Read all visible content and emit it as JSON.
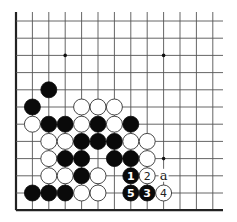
{
  "diagram": {
    "type": "go-board-fragment",
    "visible_columns": 13,
    "visible_rows": 12,
    "edges": [
      "left",
      "bottom"
    ],
    "colors": {
      "black": "#0a0a0a",
      "white": "#ffffff",
      "line": "#555555"
    },
    "star_points": [
      {
        "col": 3,
        "row": 2
      },
      {
        "col": 9,
        "row": 2
      },
      {
        "col": 9,
        "row": 8
      }
    ],
    "stones": [
      {
        "col": 2,
        "row": 4,
        "color": "black"
      },
      {
        "col": 1,
        "row": 5,
        "color": "black"
      },
      {
        "col": 4,
        "row": 5,
        "color": "white"
      },
      {
        "col": 5,
        "row": 5,
        "color": "white"
      },
      {
        "col": 6,
        "row": 5,
        "color": "white"
      },
      {
        "col": 1,
        "row": 6,
        "color": "white"
      },
      {
        "col": 2,
        "row": 6,
        "color": "black"
      },
      {
        "col": 3,
        "row": 6,
        "color": "black"
      },
      {
        "col": 4,
        "row": 6,
        "color": "white"
      },
      {
        "col": 5,
        "row": 6,
        "color": "black"
      },
      {
        "col": 6,
        "row": 6,
        "color": "white"
      },
      {
        "col": 7,
        "row": 6,
        "color": "black"
      },
      {
        "col": 2,
        "row": 7,
        "color": "white"
      },
      {
        "col": 3,
        "row": 7,
        "color": "white"
      },
      {
        "col": 4,
        "row": 7,
        "color": "black"
      },
      {
        "col": 5,
        "row": 7,
        "color": "black"
      },
      {
        "col": 6,
        "row": 7,
        "color": "black"
      },
      {
        "col": 7,
        "row": 7,
        "color": "white"
      },
      {
        "col": 8,
        "row": 7,
        "color": "white"
      },
      {
        "col": 2,
        "row": 8,
        "color": "white"
      },
      {
        "col": 3,
        "row": 8,
        "color": "black"
      },
      {
        "col": 4,
        "row": 8,
        "color": "black"
      },
      {
        "col": 6,
        "row": 8,
        "color": "black"
      },
      {
        "col": 7,
        "row": 8,
        "color": "black"
      },
      {
        "col": 8,
        "row": 8,
        "color": "white"
      },
      {
        "col": 2,
        "row": 9,
        "color": "white"
      },
      {
        "col": 3,
        "row": 9,
        "color": "white"
      },
      {
        "col": 4,
        "row": 9,
        "color": "black"
      },
      {
        "col": 5,
        "row": 9,
        "color": "white"
      },
      {
        "col": 7,
        "row": 9,
        "color": "black",
        "label": "1"
      },
      {
        "col": 8,
        "row": 9,
        "color": "white",
        "label": "2"
      },
      {
        "col": 1,
        "row": 10,
        "color": "black"
      },
      {
        "col": 2,
        "row": 10,
        "color": "black"
      },
      {
        "col": 3,
        "row": 10,
        "color": "black"
      },
      {
        "col": 4,
        "row": 10,
        "color": "white"
      },
      {
        "col": 5,
        "row": 10,
        "color": "white"
      },
      {
        "col": 7,
        "row": 10,
        "color": "black",
        "label": "5"
      },
      {
        "col": 8,
        "row": 10,
        "color": "black",
        "label": "3"
      },
      {
        "col": 9,
        "row": 10,
        "color": "white",
        "label": "4"
      }
    ],
    "point_labels": [
      {
        "col": 9,
        "row": 9,
        "text": "a"
      }
    ]
  }
}
